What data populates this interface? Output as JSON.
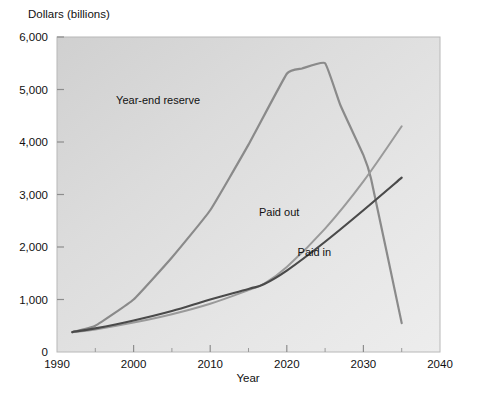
{
  "chart_data": {
    "type": "line",
    "title": "",
    "subtitle": "",
    "xlabel": "Year",
    "ylabel": "Dollars (billions)",
    "xlim": [
      1990,
      2040
    ],
    "ylim": [
      0,
      6000
    ],
    "xticks": [
      1990,
      2000,
      2010,
      2020,
      2030,
      2040
    ],
    "xticklabels": [
      "1990",
      "2000",
      "2010",
      "2020",
      "2030",
      "2040"
    ],
    "xminorticks": [
      1995,
      2005,
      2015,
      2025,
      2035
    ],
    "yticks": [
      0,
      1000,
      2000,
      3000,
      4000,
      5000,
      6000
    ],
    "yticklabels": [
      "0",
      "1,000",
      "2,000",
      "3,000",
      "4,000",
      "5,000",
      "6,000"
    ],
    "grid": false,
    "legend": "inline-annotations",
    "series": [
      {
        "name": "Year-end reserve",
        "color": "#8a8a8a",
        "linewidth": 2.2,
        "x": [
          1992,
          1995,
          2000,
          2005,
          2010,
          2015,
          2020,
          2022,
          2025,
          2027,
          2030,
          2031,
          2035
        ],
        "values": [
          380,
          500,
          1000,
          1800,
          2700,
          3950,
          5300,
          5400,
          5500,
          4700,
          3750,
          3300,
          550
        ]
      },
      {
        "name": "Paid out",
        "color": "#9a9a9a",
        "linewidth": 2.0,
        "x": [
          1992,
          1995,
          2000,
          2005,
          2010,
          2015,
          2017,
          2020,
          2025,
          2030,
          2035
        ],
        "values": [
          375,
          430,
          560,
          720,
          920,
          1180,
          1300,
          1620,
          2350,
          3250,
          4300
        ]
      },
      {
        "name": "Paid in",
        "color": "#4a4a4a",
        "linewidth": 2.2,
        "x": [
          1992,
          1995,
          2000,
          2005,
          2010,
          2015,
          2017,
          2020,
          2025,
          2030,
          2035
        ],
        "values": [
          380,
          450,
          600,
          780,
          1000,
          1200,
          1290,
          1550,
          2100,
          2700,
          3320
        ]
      }
    ],
    "annotations": [
      {
        "text": "Year-end reserve",
        "x": 2003.2,
        "y": 4720
      },
      {
        "text": "Paid out",
        "x": 2019.0,
        "y": 2600
      },
      {
        "text": "Paid in",
        "x": 2023.6,
        "y": 1830
      }
    ],
    "colors": {
      "plot_background_light": "#e9e9e9",
      "plot_background_dark": "#d2d2d2",
      "frame": "#b4b4b4",
      "text": "#111111",
      "paid_in": "#4a4a4a",
      "paid_out": "#9a9a9a",
      "reserve": "#8a8a8a"
    }
  }
}
